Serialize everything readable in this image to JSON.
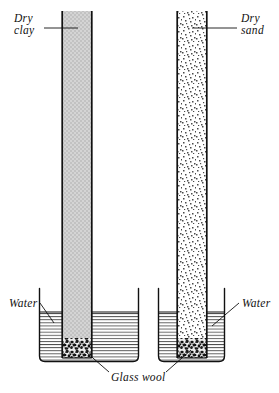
{
  "figure": {
    "type": "scientific-diagram",
    "background_color": "#ffffff",
    "ink_color": "#111111",
    "width": 279,
    "height": 393
  },
  "labels": {
    "dry_clay_line1": "Dry",
    "dry_clay_line2": "clay",
    "dry_sand_line1": "Dry",
    "dry_sand_line2": "sand",
    "water_left": "Water",
    "water_right": "Water",
    "glass_wool": "Glass wool"
  },
  "apparatus": {
    "left_assembly": {
      "name": "dry-clay-column",
      "tube": {
        "fill_material": "Dry clay",
        "fill_appearance": "uniform light gray",
        "fill_color": "#cfcfcf",
        "x_left": 62,
        "x_right": 92,
        "y_top": 11,
        "y_bottom": 358
      },
      "beaker": {
        "x_left": 38,
        "x_right": 140,
        "y_top": 288,
        "y_bottom": 362,
        "water_level_y": 312,
        "water_appearance": "horizontal hatch lines",
        "water_color": "#555555"
      },
      "glass_wool_plug": {
        "y_top": 338,
        "y_bottom": 358,
        "appearance": "dark speckled fibrous mass"
      }
    },
    "right_assembly": {
      "name": "dry-sand-column",
      "tube": {
        "fill_material": "Dry sand",
        "fill_appearance": "coarse random stipple",
        "fill_color": "#9a9a9a",
        "x_left": 177,
        "x_right": 207,
        "y_top": 11,
        "y_bottom": 358
      },
      "beaker": {
        "x_left": 158,
        "x_right": 225,
        "y_top": 288,
        "y_bottom": 362,
        "water_level_y": 312,
        "water_appearance": "horizontal hatch lines",
        "water_color": "#555555"
      },
      "glass_wool_plug": {
        "y_top": 338,
        "y_bottom": 358,
        "appearance": "dark speckled fibrous mass"
      }
    }
  },
  "leaders": {
    "dry_clay": {
      "from_x": 44,
      "from_y": 28,
      "to_x": 76,
      "to_y": 28
    },
    "dry_sand": {
      "from_x": 237,
      "from_y": 28,
      "to_x": 194,
      "to_y": 28
    },
    "water_left": {
      "from_x": 40,
      "from_y": 303,
      "to_x": 53,
      "to_y": 322
    },
    "water_right": {
      "from_x": 238,
      "from_y": 303,
      "to_x": 213,
      "to_y": 325
    },
    "glass_wool_left": {
      "from_x": 107,
      "from_y": 374,
      "to_x": 85,
      "to_y": 352
    },
    "glass_wool_right": {
      "from_x": 168,
      "from_y": 374,
      "to_x": 190,
      "to_y": 350
    }
  }
}
